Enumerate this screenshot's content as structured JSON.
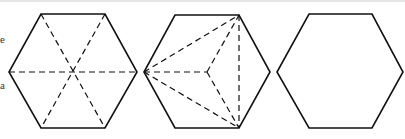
{
  "figure": {
    "edge_text": [
      "e",
      "a"
    ],
    "colors": {
      "stroke": "#111111",
      "background": "#ffffff"
    },
    "hexagons": [
      {
        "name": "hexagon-center-fan",
        "outline": [
          [
            41,
            14
          ],
          [
            105,
            14
          ],
          [
            137,
            72
          ],
          [
            105,
            128
          ],
          [
            41,
            128
          ],
          [
            9,
            72
          ]
        ],
        "dashed": [
          [
            [
              41,
              14
            ],
            [
              105,
              128
            ]
          ],
          [
            [
              105,
              14
            ],
            [
              41,
              128
            ]
          ],
          [
            [
              9,
              72
            ],
            [
              137,
              72
            ]
          ]
        ],
        "center": [
          73,
          72
        ]
      },
      {
        "name": "hexagon-vertex-fan",
        "outline": [
          [
            175,
            15
          ],
          [
            239,
            15
          ],
          [
            270,
            72
          ],
          [
            239,
            128
          ],
          [
            175,
            128
          ],
          [
            144,
            72
          ]
        ],
        "dashed": [
          [
            [
              144,
              72
            ],
            [
              239,
              15
            ]
          ],
          [
            [
              144,
              72
            ],
            [
              207,
              72
            ]
          ],
          [
            [
              144,
              72
            ],
            [
              239,
              128
            ]
          ],
          [
            [
              239,
              15
            ],
            [
              239,
              128
            ]
          ],
          [
            [
              207,
              72
            ],
            [
              239,
              15
            ]
          ],
          [
            [
              207,
              72
            ],
            [
              239,
              128
            ]
          ]
        ],
        "center": [
          207,
          72
        ]
      },
      {
        "name": "hexagon-plain",
        "outline": [
          [
            309,
            14
          ],
          [
            372,
            14
          ],
          [
            403,
            72
          ],
          [
            372,
            128
          ],
          [
            309,
            128
          ],
          [
            277,
            72
          ]
        ],
        "dashed": []
      }
    ]
  }
}
